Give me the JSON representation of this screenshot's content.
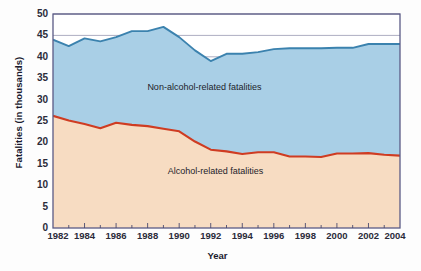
{
  "chart_data": {
    "type": "area",
    "stacked": true,
    "title": "",
    "xlabel": "Year",
    "ylabel": "Fatalities (in thousands)",
    "xlim": [
      1982,
      2004
    ],
    "ylim": [
      0,
      50
    ],
    "ytick_labels": [
      "0",
      "5",
      "10",
      "15",
      "20",
      "25",
      "30",
      "35",
      "40",
      "45",
      "50"
    ],
    "ytick_values": [
      0,
      5,
      10,
      15,
      20,
      25,
      30,
      35,
      40,
      45,
      50
    ],
    "xtick_labels": [
      "1982",
      "1984",
      "1986",
      "1988",
      "1990",
      "1992",
      "1994",
      "1996",
      "1998",
      "2000",
      "2002",
      "2004"
    ],
    "xtick_values": [
      1982,
      1984,
      1986,
      1988,
      1990,
      1992,
      1994,
      1996,
      1998,
      2000,
      2002,
      2004
    ],
    "minor_xticks": [
      1983,
      1985,
      1987,
      1989,
      1991,
      1993,
      1995,
      1997,
      1999,
      2001,
      2003
    ],
    "grid": "horizontal",
    "legend_position": "inline-annotations",
    "x": [
      1982,
      1983,
      1984,
      1985,
      1986,
      1987,
      1988,
      1989,
      1990,
      1991,
      1992,
      1993,
      1994,
      1995,
      1996,
      1997,
      1998,
      1999,
      2000,
      2001,
      2002,
      2003,
      2004
    ],
    "series": [
      {
        "name": "Alcohol-related fatalities",
        "color": "#f7dcc2",
        "line_color": "#cf3c22",
        "values": [
          26.2,
          25.1,
          24.3,
          23.3,
          24.6,
          24.1,
          23.8,
          23.2,
          22.6,
          20.2,
          18.3,
          17.9,
          17.3,
          17.7,
          17.7,
          16.7,
          16.7,
          16.6,
          17.4,
          17.4,
          17.5,
          17.1,
          16.9
        ]
      },
      {
        "name": "Non-alcohol-related fatalities",
        "color": "#a9cfe6",
        "line_color": "#3b82ae",
        "values": [
          17.8,
          17.4,
          20.0,
          20.3,
          20.0,
          21.9,
          22.2,
          23.8,
          22.0,
          21.3,
          20.7,
          22.8,
          23.4,
          23.4,
          24.1,
          25.3,
          25.3,
          25.4,
          24.7,
          24.7,
          25.5,
          25.9,
          26.1
        ]
      }
    ],
    "totals": [
      44.0,
      42.5,
      44.3,
      43.6,
      44.6,
      46.0,
      46.0,
      47.0,
      44.6,
      41.5,
      39.0,
      40.7,
      40.7,
      41.1,
      41.8,
      42.0,
      42.0,
      42.0,
      42.1,
      42.1,
      43.0,
      43.0,
      43.0
    ],
    "annotations": [
      {
        "text": "Non-alcohol-related fatalities",
        "x": 1991.6,
        "y": 32.2
      },
      {
        "text": "Alcohol-related fatalities",
        "x": 1992.3,
        "y": 12.6
      }
    ],
    "colors": {
      "alcohol_fill": "#f7dcc2",
      "alcohol_line": "#cf3c22",
      "nonalcohol_fill": "#a9cfe6",
      "nonalcohol_line": "#3b82ae",
      "gridline": "#8b8ba8",
      "axis": "#5b5b86",
      "text": "#1d1d2b",
      "background": "#fdfdfd"
    }
  }
}
